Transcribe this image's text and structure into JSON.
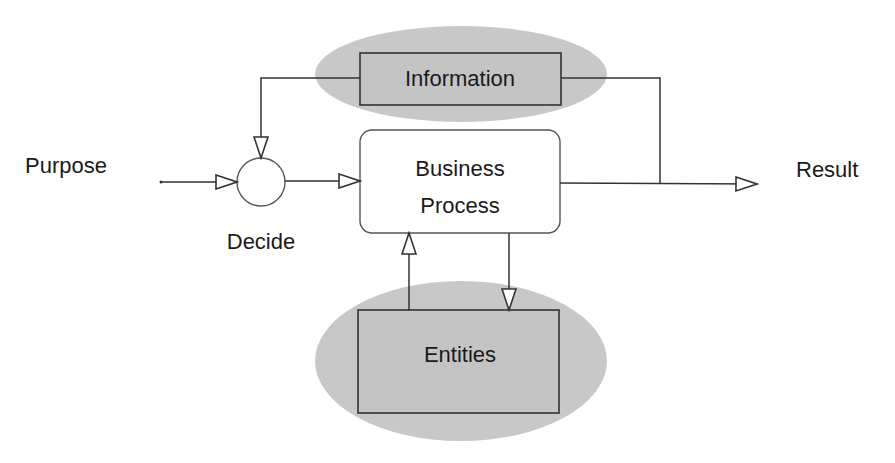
{
  "diagram": {
    "labels": {
      "purpose": "Purpose",
      "decide": "Decide",
      "result": "Result"
    },
    "nodes": {
      "information": {
        "label": "Information"
      },
      "business_process": {
        "line1": "Business",
        "line2": "Process"
      },
      "entities": {
        "label": "Entities"
      }
    },
    "colors": {
      "ellipse_fill": "#c8c8c8",
      "box_fill_shaded": "#c4c4c4",
      "line": "#333333",
      "background": "#ffffff"
    }
  }
}
